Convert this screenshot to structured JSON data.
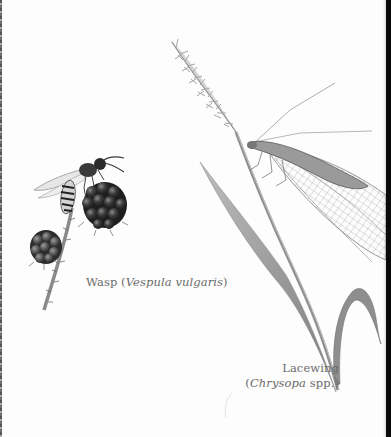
{
  "plate": {
    "background": "#fdfdfd",
    "edge_right_color": "#0a0a0a",
    "ink_color": "#6b6b6b"
  },
  "subjects": [
    {
      "id": "wasp",
      "common_name": "Wasp",
      "open_paren": "(",
      "scientific_name": "Vespula vulgaris",
      "close_paren": ")",
      "depicted_on": "blackberries"
    },
    {
      "id": "lacewing",
      "common_name": "Lacewing",
      "open_paren": "(",
      "scientific_name": "Chrysopa",
      "suffix": " spp.)",
      "depicted_on": "grass stem"
    }
  ]
}
